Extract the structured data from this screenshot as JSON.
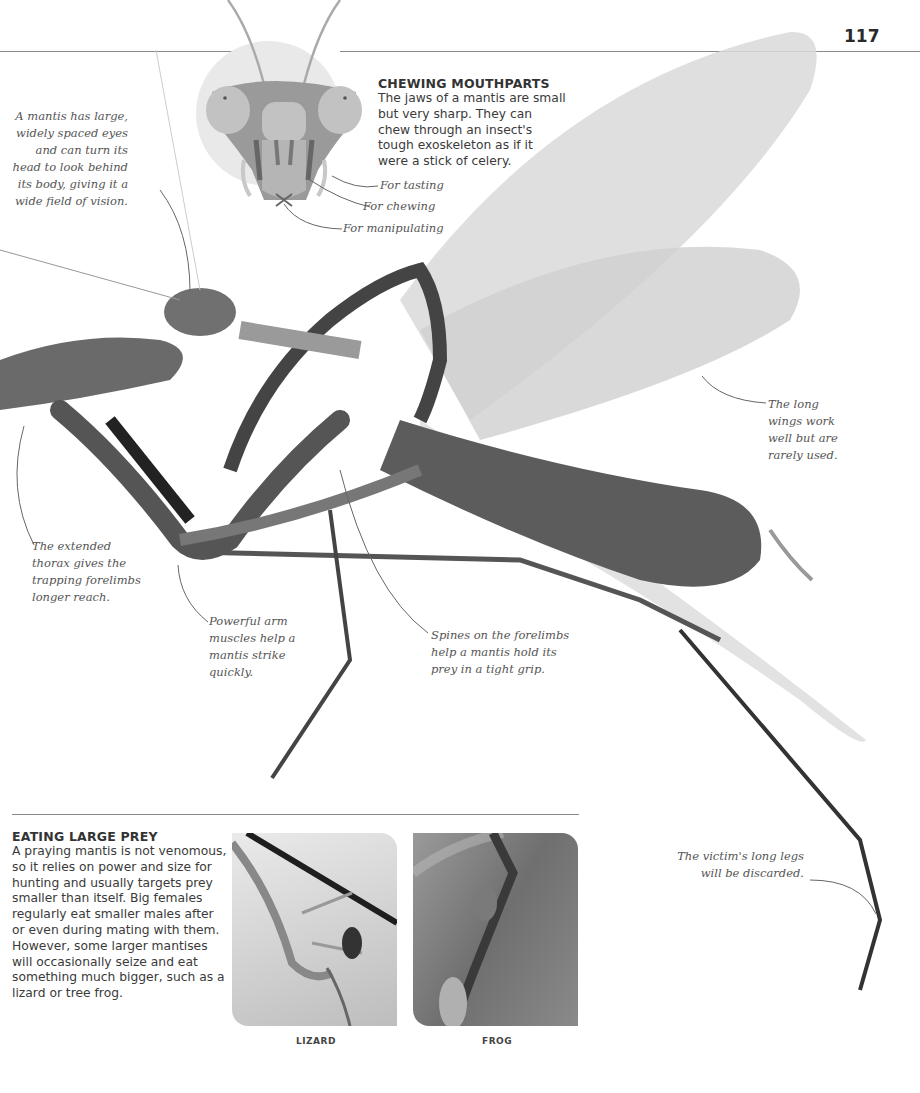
{
  "page": {
    "number": "117"
  },
  "mouthparts": {
    "title": "CHEWING MOUTHPARTS",
    "text": "The jaws of a mantis are small\n but very sharp. They can\n chew through an insect's\n tough exoskeleton as if it\nwere a stick of celery.",
    "labels": [
      "For tasting",
      "For chewing",
      "For manipulating"
    ]
  },
  "annotations": {
    "eyes": "A mantis has large,\nwidely spaced eyes\nand can turn its\nhead to look behind\nits body, giving it a\nwide field of vision.",
    "wings": "The long\nwings work\nwell but are\nrarely used.",
    "thorax": "The extended\nthorax gives the\ntrapping forelimbs\nlonger reach.",
    "arm_muscles": "Powerful arm\nmuscles help a\nmantis strike\nquickly.",
    "spines": "Spines on the forelimbs\nhelp a mantis hold its\nprey in a tight grip.",
    "victim_legs": "The victim's long legs\nwill be discarded."
  },
  "prey_box": {
    "title": "EATING LARGE PREY",
    "text": "A praying mantis is not venomous, so it relies on power and size for hunting and usually targets prey smaller than itself. Big females regularly eat smaller males after or even during mating with them. However, some larger mantises will occasionally seize and eat something much bigger, such as a lizard or tree frog."
  },
  "photos": [
    {
      "caption": "LIZARD"
    },
    {
      "caption": "FROG"
    }
  ],
  "colors": {
    "rule": "#8a8a8a",
    "text": "#333333",
    "annotation": "#555555",
    "head_bg": "#e9e9e9"
  }
}
